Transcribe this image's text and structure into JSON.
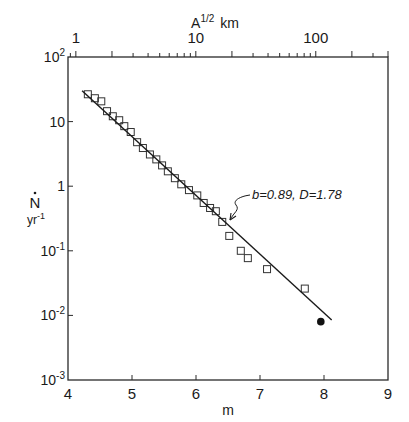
{
  "chart_data": {
    "type": "scatter",
    "title": "",
    "xlabel": "m",
    "ylabel": "Ṅ",
    "ylabel_units": "yr⁻¹",
    "top_xlabel": "A¹ᐟ² km",
    "top_xlabel_text": "A",
    "top_xlabel_sup": "1/2",
    "top_xlabel_unit": "km",
    "xlim": [
      4,
      9
    ],
    "ylim": [
      0.001,
      100
    ],
    "yscale": "log",
    "x_ticks": [
      "4",
      "5",
      "6",
      "7",
      "8",
      "9"
    ],
    "y_ticks": [
      {
        "base": "10",
        "exp": "2",
        "value": 100
      },
      {
        "base": "10",
        "exp": "",
        "value": 10
      },
      {
        "base": "1",
        "exp": "",
        "value": 1
      },
      {
        "base": "10",
        "exp": "-1",
        "value": 0.1
      },
      {
        "base": "10",
        "exp": "-2",
        "value": 0.01
      },
      {
        "base": "10",
        "exp": "-3",
        "value": 0.001
      }
    ],
    "top_axis": {
      "scale": "log",
      "ticks": [
        "1",
        "10",
        "100"
      ],
      "tick_values": [
        1,
        10,
        100
      ],
      "range": [
        0.86,
        400
      ]
    },
    "series": [
      {
        "name": "observed",
        "marker": "open-square",
        "x": [
          4.31,
          4.42,
          4.52,
          4.61,
          4.7,
          4.8,
          4.88,
          4.98,
          5.08,
          5.17,
          5.28,
          5.38,
          5.47,
          5.56,
          5.67,
          5.77,
          5.89,
          6.02,
          6.12,
          6.22,
          6.31,
          6.41,
          6.52,
          6.7,
          6.81,
          7.11,
          7.7
        ],
        "y": [
          26.5,
          23,
          20.6,
          14.5,
          12.1,
          10.5,
          8.5,
          6.9,
          4.8,
          3.9,
          3.1,
          2.6,
          2.1,
          1.7,
          1.33,
          1.07,
          0.87,
          0.72,
          0.55,
          0.46,
          0.41,
          0.28,
          0.17,
          0.1,
          0.077,
          0.052,
          0.026
        ]
      },
      {
        "name": "filled point",
        "marker": "filled-circle",
        "x": [
          7.95
        ],
        "y": [
          0.008
        ]
      },
      {
        "name": "fit",
        "marker": "line",
        "x": [
          4.22,
          8.12
        ],
        "y": [
          30,
          0.0085
        ]
      }
    ],
    "annotations": [
      {
        "text": "b=0.89, D=1.78",
        "points_to": {
          "x": 6.5,
          "y": 0.26
        }
      }
    ],
    "grid": false,
    "legend": null
  }
}
